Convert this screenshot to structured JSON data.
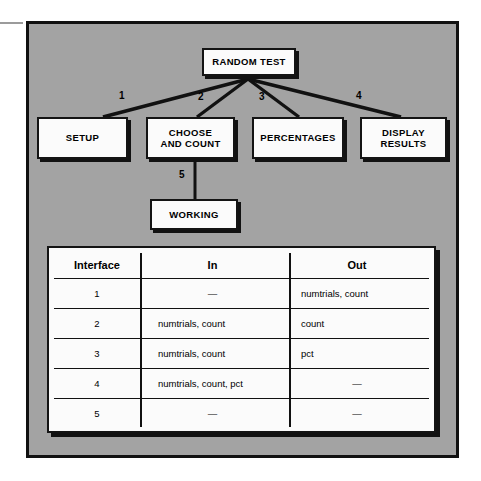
{
  "figure": {
    "title_node": "RANDOM TEST",
    "background_color": "#a3a3a3",
    "border_color": "#111111",
    "node_fill": "#fbfbfb"
  },
  "flowchart": {
    "root": {
      "label": "RANDOM TEST"
    },
    "children": [
      {
        "label": "SETUP",
        "edge": "1"
      },
      {
        "label_line1": "CHOOSE",
        "label_line2": "AND COUNT",
        "edge": "2"
      },
      {
        "label": "PERCENTAGES",
        "edge": "3"
      },
      {
        "label_line1": "DISPLAY",
        "label_line2": "RESULTS",
        "edge": "4"
      }
    ],
    "sub": {
      "label": "WORKING",
      "edge": "5",
      "parent": "CHOOSE AND COUNT"
    },
    "edge_labels": [
      "1",
      "2",
      "3",
      "4",
      "5"
    ]
  },
  "table": {
    "columns": [
      "Interface",
      "In",
      "Out"
    ],
    "rows": [
      {
        "interface": "1",
        "in": "—",
        "out": "numtrials, count"
      },
      {
        "interface": "2",
        "in": "numtrials, count",
        "out": "count"
      },
      {
        "interface": "3",
        "in": "numtrials, count",
        "out": "pct"
      },
      {
        "interface": "4",
        "in": "numtrials, count, pct",
        "out": "—"
      },
      {
        "interface": "5",
        "in": "—",
        "out": "—"
      }
    ]
  }
}
